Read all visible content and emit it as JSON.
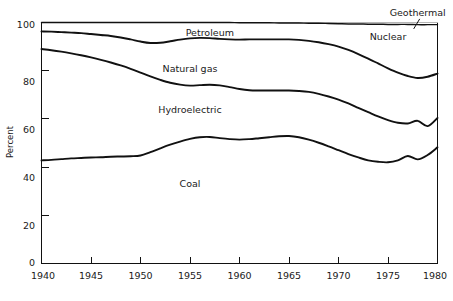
{
  "chart_data": {
    "type": "area",
    "title": "",
    "subtitle": "",
    "xlabel": "",
    "ylabel": "Percent",
    "xlim": [
      1940,
      1980
    ],
    "ylim": [
      0,
      100
    ],
    "grid": false,
    "legend_position": "inline-band-labels",
    "stacking": "cumulative-percent-bands",
    "x_ticks": [
      "1940",
      "1945",
      "1950",
      "1955",
      "1960",
      "1965",
      "1970",
      "1975",
      "1980"
    ],
    "y_ticks": [
      "0",
      "20",
      "40",
      "60",
      "80",
      "100"
    ],
    "x": [
      1940,
      1941,
      1942,
      1943,
      1944,
      1945,
      1946,
      1947,
      1948,
      1949,
      1950,
      1951,
      1952,
      1953,
      1954,
      1955,
      1956,
      1957,
      1958,
      1959,
      1960,
      1961,
      1962,
      1963,
      1964,
      1965,
      1966,
      1967,
      1968,
      1969,
      1970,
      1971,
      1972,
      1973,
      1974,
      1975,
      1976,
      1977,
      1978,
      1979,
      1980
    ],
    "series": [
      {
        "name": "Coal",
        "label": "Coal",
        "label_x": 1955,
        "label_y": 33,
        "cumulative_top": [
          42.8,
          43.0,
          43.3,
          43.6,
          43.8,
          44.0,
          44.1,
          44.3,
          44.4,
          44.5,
          44.8,
          46.2,
          47.8,
          49.3,
          50.6,
          51.7,
          52.4,
          52.5,
          52.0,
          51.6,
          51.4,
          51.6,
          52.0,
          52.4,
          52.8,
          52.9,
          52.4,
          51.4,
          50.1,
          48.6,
          47.0,
          45.4,
          44.0,
          42.8,
          42.2,
          42.0,
          42.8,
          44.6,
          43.2,
          45.0,
          48.2
        ]
      },
      {
        "name": "Hydroelectric",
        "label": "Hydroelectric",
        "label_x": 1955,
        "label_y": 64,
        "cumulative_top": [
          89.0,
          88.5,
          87.9,
          87.2,
          86.4,
          85.5,
          84.5,
          83.4,
          82.2,
          80.8,
          79.2,
          77.6,
          76.2,
          75.0,
          74.2,
          73.8,
          74.0,
          74.2,
          73.9,
          73.2,
          72.4,
          71.9,
          71.8,
          71.8,
          71.8,
          71.8,
          71.6,
          71.2,
          70.4,
          69.3,
          68.0,
          66.4,
          64.6,
          62.8,
          61.0,
          59.5,
          58.4,
          58.1,
          59.2,
          57.0,
          60.4
        ]
      },
      {
        "name": "Natural gas",
        "label": "Natural gas",
        "label_x": 1955,
        "label_y": 81,
        "cumulative_top": [
          96.3,
          96.2,
          96.0,
          95.8,
          95.6,
          95.2,
          94.8,
          94.4,
          93.8,
          93.0,
          92.1,
          91.5,
          91.6,
          92.2,
          92.9,
          93.4,
          93.6,
          93.5,
          93.2,
          93.0,
          92.9,
          93.0,
          93.0,
          93.0,
          93.0,
          93.0,
          92.8,
          92.4,
          91.8,
          91.0,
          90.0,
          88.6,
          86.9,
          85.0,
          83.0,
          81.0,
          79.2,
          77.8,
          77.0,
          77.5,
          78.8
        ]
      },
      {
        "name": "Petroleum",
        "label": "Petroleum",
        "label_x": 1957,
        "label_y": 96,
        "cumulative_top": [
          100.0,
          100.0,
          100.0,
          100.0,
          100.0,
          100.0,
          100.0,
          100.0,
          100.0,
          100.0,
          100.0,
          100.0,
          100.0,
          100.0,
          100.0,
          100.0,
          100.0,
          100.0,
          100.0,
          100.0,
          99.9,
          99.9,
          99.9,
          99.9,
          99.8,
          99.8,
          99.8,
          99.7,
          99.7,
          99.6,
          99.5,
          99.4,
          99.4,
          99.3,
          99.3,
          99.2,
          99.2,
          99.2,
          99.1,
          99.1,
          99.1
        ]
      }
    ],
    "annotations": [
      {
        "name": "Nuclear",
        "label": "Nuclear",
        "label_x": 1975,
        "label_y": 94,
        "placement": "inside-top-right-band"
      },
      {
        "name": "Geothermal",
        "label": "Geothermal",
        "label_x": 1978,
        "label_y": 104,
        "placement": "above-plot-with-leader",
        "leader": true
      }
    ]
  }
}
